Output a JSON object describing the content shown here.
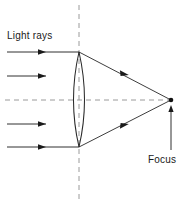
{
  "diagram": {
    "type": "optics-ray-diagram",
    "colors": {
      "stroke": "#1a1a1a",
      "dashed": "#9a9a9a",
      "background": "#ffffff",
      "text": "#1a1a1a"
    },
    "labels": {
      "light_rays": "Light rays",
      "focus": "Focus"
    },
    "geometry": {
      "canvas_width": 191,
      "canvas_height": 206,
      "optical_axis_y": 100,
      "optical_axis_x_start": 5,
      "optical_axis_x_end": 176,
      "lens_center_x": 79,
      "lens_top_y": 52,
      "lens_bottom_y": 147,
      "lens_half_width": 11,
      "lens_vertical_axis_x": 79,
      "lens_vertical_axis_y_start": 5,
      "lens_vertical_axis_y_end": 200,
      "focus_x": 171,
      "focus_y": 100,
      "focus_dot_radius": 2.2
    },
    "incoming_rays": [
      {
        "name": "incoming-ray-1",
        "y": 52,
        "x_start": 7,
        "x_end": 79,
        "arrow_x": 44
      },
      {
        "name": "incoming-ray-2",
        "y": 76,
        "x_start": 7,
        "x_end": 46,
        "arrow_x": 44
      },
      {
        "name": "incoming-ray-3",
        "y": 124,
        "x_start": 7,
        "x_end": 46,
        "arrow_x": 44
      },
      {
        "name": "incoming-ray-4",
        "y": 147,
        "x_start": 7,
        "x_end": 79,
        "arrow_x": 44
      }
    ],
    "refracted_rays": [
      {
        "name": "refracted-ray-upper",
        "x_start": 79,
        "y_start": 52,
        "x_end": 171,
        "y_end": 100,
        "arrow_t": 0.52
      },
      {
        "name": "refracted-ray-lower",
        "x_start": 79,
        "y_start": 147,
        "x_end": 171,
        "y_end": 100,
        "arrow_t": 0.52
      }
    ],
    "focus_pointer": {
      "name": "focus-pointer-arrow",
      "x": 171,
      "y_start": 150,
      "y_end": 107
    }
  }
}
